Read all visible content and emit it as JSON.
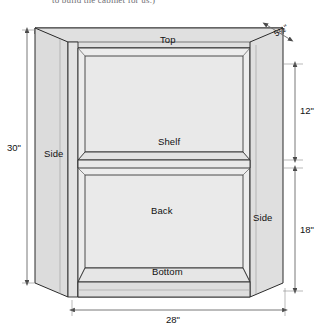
{
  "caption": {
    "text": "to build the cabinet for us.)"
  },
  "diagram": {
    "parts": [
      {
        "id": "top",
        "label": "Top"
      },
      {
        "id": "shelf",
        "label": "Shelf"
      },
      {
        "id": "back",
        "label": "Back"
      },
      {
        "id": "side_left",
        "label": "Side"
      },
      {
        "id": "side_right",
        "label": "Side"
      },
      {
        "id": "bottom",
        "label": "Bottom"
      }
    ],
    "dimensions": [
      {
        "id": "height_overall",
        "value": "30\"",
        "orientation": "vertical",
        "position": "left"
      },
      {
        "id": "width_overall",
        "value": "28\"",
        "orientation": "horizontal",
        "position": "bottom"
      },
      {
        "id": "upper_opening",
        "value": "12\"",
        "orientation": "vertical",
        "position": "right-upper"
      },
      {
        "id": "lower_opening",
        "value": "18\"",
        "orientation": "vertical",
        "position": "right-lower"
      },
      {
        "id": "depth",
        "value": "5½\"",
        "orientation": "diagonal",
        "position": "top-right"
      }
    ],
    "colors": {
      "outline": "#2b2b2b",
      "face_fill": "#e9e9e9",
      "top_fill": "#e4e4e4",
      "side_fill": "#dedede",
      "interior_fill": "#ebebeb",
      "dimension_line": "#6a6a6a",
      "text": "#111111",
      "background": "#ffffff"
    }
  }
}
